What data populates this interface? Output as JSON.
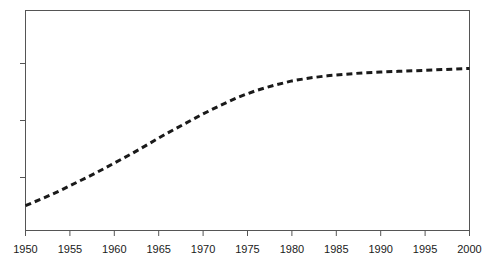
{
  "chart_data": {
    "type": "line",
    "title": "",
    "subtitle": "",
    "xlabel": "",
    "ylabel": "",
    "xlim": [
      1950,
      2000
    ],
    "ylim": [
      0,
      3
    ],
    "grid": false,
    "legend": null,
    "line_style": "dotted",
    "line_color": "#1a1a1a",
    "line_width": 3,
    "frame": "box",
    "x_tick_labels": [
      "1950",
      "1955",
      "1960",
      "1965",
      "1970",
      "1975",
      "1980",
      "1985",
      "1990",
      "1995",
      "2000"
    ],
    "x_ticks": [
      1950,
      1955,
      1960,
      1965,
      1970,
      1975,
      1980,
      1985,
      1990,
      1995,
      2000
    ],
    "y_ticks": [
      1,
      2,
      3
    ],
    "y_tick_labels": [
      "",
      "",
      ""
    ],
    "series": [
      {
        "name": "",
        "x": [
          1950,
          1952,
          1954,
          1956,
          1958,
          1960,
          1962,
          1964,
          1966,
          1968,
          1970,
          1972,
          1974,
          1976,
          1978,
          1980,
          1982,
          1984,
          1986,
          1988,
          1990,
          1992,
          1994,
          1996,
          1998,
          2000
        ],
        "values": [
          0.34,
          0.44,
          0.55,
          0.67,
          0.79,
          0.92,
          1.05,
          1.19,
          1.33,
          1.46,
          1.59,
          1.71,
          1.82,
          1.91,
          1.98,
          2.04,
          2.08,
          2.11,
          2.13,
          2.15,
          2.16,
          2.17,
          2.18,
          2.19,
          2.2,
          2.21
        ]
      }
    ]
  },
  "axes": {
    "x_axis_name": "x-axis",
    "y_axis_name": "y-axis"
  }
}
